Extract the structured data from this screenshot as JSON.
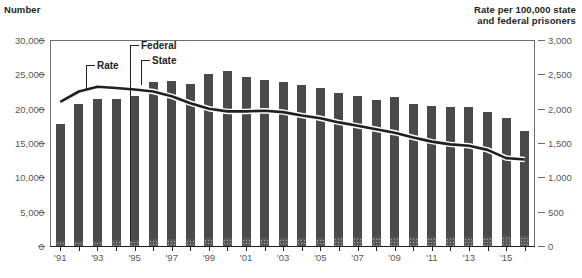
{
  "chart_data": {
    "type": "bar",
    "title": "",
    "subtitle": "",
    "ylabel": "Number",
    "y2label": "Rate per 100,000 state\nand federal prisoners",
    "xlabel": "",
    "ylim": [
      0,
      30000
    ],
    "y2lim": [
      0,
      3000
    ],
    "grid": false,
    "legend_position": "in-plot-callouts",
    "y_ticks": [
      "0",
      "5,000",
      "10,000",
      "15,000",
      "20,000",
      "25,000",
      "30,000"
    ],
    "y_tick_values": [
      0,
      5000,
      10000,
      15000,
      20000,
      25000,
      30000
    ],
    "y2_ticks": [
      "0",
      "500",
      "1,000",
      "1,500",
      "2,000",
      "2,500",
      "3,000"
    ],
    "y2_tick_values": [
      0,
      500,
      1000,
      1500,
      2000,
      2500,
      3000
    ],
    "x": [
      1991,
      1992,
      1993,
      1994,
      1995,
      1996,
      1997,
      1998,
      1999,
      2000,
      2001,
      2002,
      2003,
      2004,
      2005,
      2006,
      2007,
      2008,
      2009,
      2010,
      2011,
      2012,
      2013,
      2014,
      2015,
      2016
    ],
    "x_tick_labels": [
      "'91",
      "'93",
      "'95",
      "'97",
      "'99",
      "'01",
      "'03",
      "'05",
      "'07",
      "'09",
      "'11",
      "'13",
      "'15"
    ],
    "x_tick_values": [
      1991,
      1993,
      1995,
      1997,
      1999,
      2001,
      2003,
      2005,
      2007,
      2009,
      2011,
      2013,
      2015
    ],
    "series": [
      {
        "name": "State",
        "kind": "bar-stack",
        "color": "#4a4a4c",
        "values": [
          17100,
          20000,
          20600,
          20600,
          20900,
          22900,
          23100,
          22500,
          23900,
          24300,
          23500,
          23000,
          22700,
          22300,
          21800,
          21100,
          20600,
          20000,
          20400,
          19500,
          19100,
          18900,
          18900,
          18200,
          17300,
          15400
        ]
      },
      {
        "name": "Federal",
        "kind": "bar-stack",
        "color": "#a7a9ac",
        "pattern": "crosshatch",
        "values": [
          700,
          750,
          800,
          850,
          900,
          1000,
          1000,
          1050,
          1100,
          1150,
          1150,
          1150,
          1150,
          1200,
          1200,
          1250,
          1250,
          1250,
          1250,
          1250,
          1250,
          1300,
          1300,
          1350,
          1400,
          1400
        ]
      },
      {
        "name": "Rate",
        "kind": "line",
        "axis": "right",
        "color": "#231f20",
        "values": [
          2100,
          2250,
          2320,
          2300,
          2280,
          2250,
          2180,
          2080,
          2000,
          1960,
          1960,
          1970,
          1950,
          1900,
          1860,
          1800,
          1750,
          1700,
          1650,
          1580,
          1520,
          1480,
          1460,
          1400,
          1280,
          1260
        ]
      }
    ],
    "annotations": [
      {
        "label": "Rate",
        "points_to": "rate-line",
        "x": 1993
      },
      {
        "label": "Federal",
        "points_to": "federal-segment",
        "x": 1996
      },
      {
        "label": "State",
        "points_to": "state-segment",
        "x": 1996
      }
    ]
  },
  "axes": {
    "left_title": "Number",
    "right_title": "Rate per 100,000 state\nand federal prisoners"
  },
  "callouts": {
    "rate": "Rate",
    "federal": "Federal",
    "state": "State"
  }
}
